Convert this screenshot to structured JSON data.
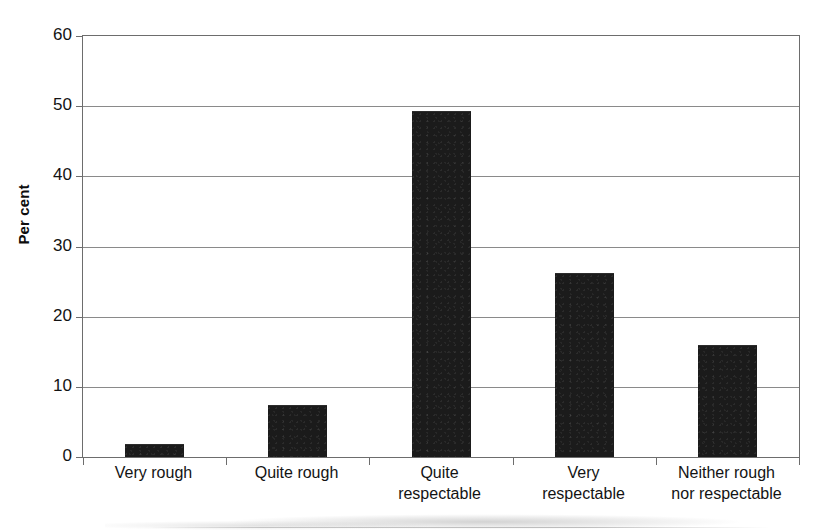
{
  "chart_data": {
    "type": "bar",
    "title": "",
    "subtitle": "",
    "xlabel": "",
    "ylabel": "Per cent",
    "categories": [
      "Very rough",
      "Quite rough",
      "Quite\nrespectable",
      "Very\nrespectable",
      "Neither rough\nnor respectable"
    ],
    "values": [
      1.8,
      7.4,
      49.3,
      26.2,
      16.0
    ],
    "ylim": [
      0,
      60
    ],
    "ytick_labels": [
      "0",
      "10",
      "20",
      "30",
      "40",
      "50",
      "60"
    ],
    "ytick_values": [
      0,
      10,
      20,
      30,
      40,
      50,
      60
    ],
    "grid": "horizontal",
    "legend": "none",
    "bar_color": "#1b1b1b",
    "axis_color": "#6d6d6d",
    "gridline_color": "#8a8a8a",
    "background_color": "#ffffff"
  },
  "axes": {
    "y_title": "Per cent"
  }
}
